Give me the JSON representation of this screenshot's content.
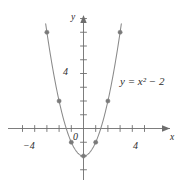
{
  "figure": {
    "kind": "cartesian-graph",
    "curve_color": "#8a8a8a",
    "axis_color": "#6e6e6e",
    "marker_color": "#7a7a7a",
    "text_color": "#2b2b2b",
    "background": "#ffffff",
    "equation_label": "y = x² − 2",
    "x_axis_label": "x",
    "y_axis_label": "y"
  },
  "chart_data": {
    "type": "line",
    "title": "",
    "subtitle": "",
    "xlabel": "x",
    "ylabel": "y",
    "equation": "y = x^2 - 2",
    "equation_display": "y = x² − 2",
    "xlim": [
      -5,
      5
    ],
    "ylim": [
      -3,
      9
    ],
    "grid": false,
    "legend": null,
    "annotations": [
      {
        "text": "y = x² − 2",
        "x": 3.6,
        "y": 4.2
      }
    ],
    "axes": {
      "x_tick_step": 1,
      "y_tick_step": 1,
      "x_ticks": [
        -5,
        -4,
        -3,
        -2,
        -1,
        0,
        1,
        2,
        3,
        4,
        5
      ],
      "y_ticks": [
        -3,
        -2,
        -1,
        0,
        1,
        2,
        3,
        4,
        5,
        6,
        7,
        8
      ],
      "x_tick_labels": [
        {
          "value": -4,
          "text": "−4"
        },
        {
          "value": 0,
          "text": "0"
        },
        {
          "value": 4,
          "text": "4"
        }
      ],
      "y_tick_labels": [
        {
          "value": 4,
          "text": "4"
        }
      ],
      "x_arrow": "positive",
      "y_arrow": "positive"
    },
    "series": [
      {
        "name": "y = x² − 2",
        "type": "parabola",
        "vertex": [
          0,
          -2
        ],
        "x_roots": [
          -1.414,
          1.414
        ],
        "x": [
          -3.1,
          -3,
          -2.5,
          -2,
          -1.5,
          -1,
          -0.5,
          0,
          0.5,
          1,
          1.5,
          2,
          2.5,
          3,
          3.1
        ],
        "values": [
          7.61,
          7,
          4.25,
          2,
          0.25,
          -1,
          -1.75,
          -2,
          -1.75,
          -1,
          0.25,
          2,
          4.25,
          7,
          7.61
        ]
      }
    ],
    "points": [
      {
        "x": -3,
        "y": 7
      },
      {
        "x": -2,
        "y": 2
      },
      {
        "x": -1,
        "y": -1
      },
      {
        "x": 0,
        "y": -2
      },
      {
        "x": 1,
        "y": -1
      },
      {
        "x": 2,
        "y": 2
      },
      {
        "x": 3,
        "y": 7
      }
    ]
  }
}
